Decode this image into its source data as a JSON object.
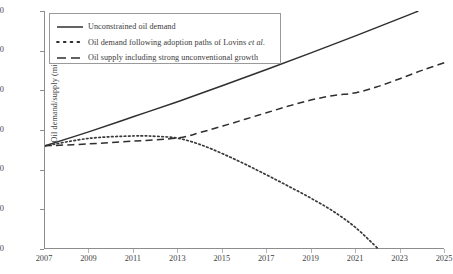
{
  "chart_data": {
    "type": "line",
    "title": "",
    "xlabel": "",
    "ylabel": "Oil demand/supply (million bbl/day)",
    "xlim": [
      2007,
      2025
    ],
    "ylim": [
      60,
      120
    ],
    "grid": false,
    "legend_position": "top-left-inside",
    "x_ticks": [
      "2007",
      "2009",
      "2011",
      "2013",
      "2015",
      "2017",
      "2019",
      "2021",
      "2023",
      "2025"
    ],
    "y_ticks": [
      "60",
      "70",
      "80",
      "90",
      "100",
      "110",
      "120"
    ],
    "series": [
      {
        "name": "Unconstrained oil demand",
        "style": "solid",
        "color": "#2f2f2f",
        "x": [
          2007,
          2009,
          2011,
          2013,
          2015,
          2017,
          2019,
          2021,
          2023,
          2023.8
        ],
        "values": [
          86.0,
          89.6,
          93.4,
          97.2,
          101.2,
          105.3,
          109.5,
          113.8,
          118.2,
          120.0
        ]
      },
      {
        "name": "Oil demand following adoption paths of Lovins et al.",
        "name_italic_tail": "et al.",
        "style": "dotted",
        "color": "#3a3a3a",
        "x": [
          2007,
          2009,
          2011,
          2012,
          2013,
          2014,
          2015,
          2016,
          2017,
          2018,
          2019,
          2020,
          2021,
          2022
        ],
        "values": [
          86.0,
          87.9,
          88.5,
          88.4,
          87.9,
          86.3,
          84.0,
          81.4,
          78.6,
          75.7,
          72.7,
          69.4,
          65.3,
          60.0
        ]
      },
      {
        "name": "Oil supply including strong unconventional growth",
        "style": "dashed",
        "color": "#2f2f2f",
        "x": [
          2007,
          2009,
          2011,
          2013,
          2014,
          2015,
          2016,
          2017,
          2018,
          2019,
          2020,
          2021,
          2022,
          2023,
          2024,
          2025
        ],
        "values": [
          86.0,
          86.5,
          87.2,
          88.0,
          89.4,
          91.0,
          92.7,
          94.4,
          96.1,
          97.6,
          98.7,
          99.4,
          101.0,
          103.0,
          105.1,
          107.0
        ]
      }
    ]
  },
  "legend": {
    "items": [
      {
        "label": "Unconstrained oil demand",
        "style": "solid"
      },
      {
        "label": "Oil demand following adoption paths of Lovins ",
        "italic": "et al.",
        "style": "dotted"
      },
      {
        "label": "Oil supply including strong unconventional growth",
        "style": "dashed"
      }
    ]
  },
  "axes": {
    "y_title": "Oil demand/supply (million bbl/day)"
  }
}
